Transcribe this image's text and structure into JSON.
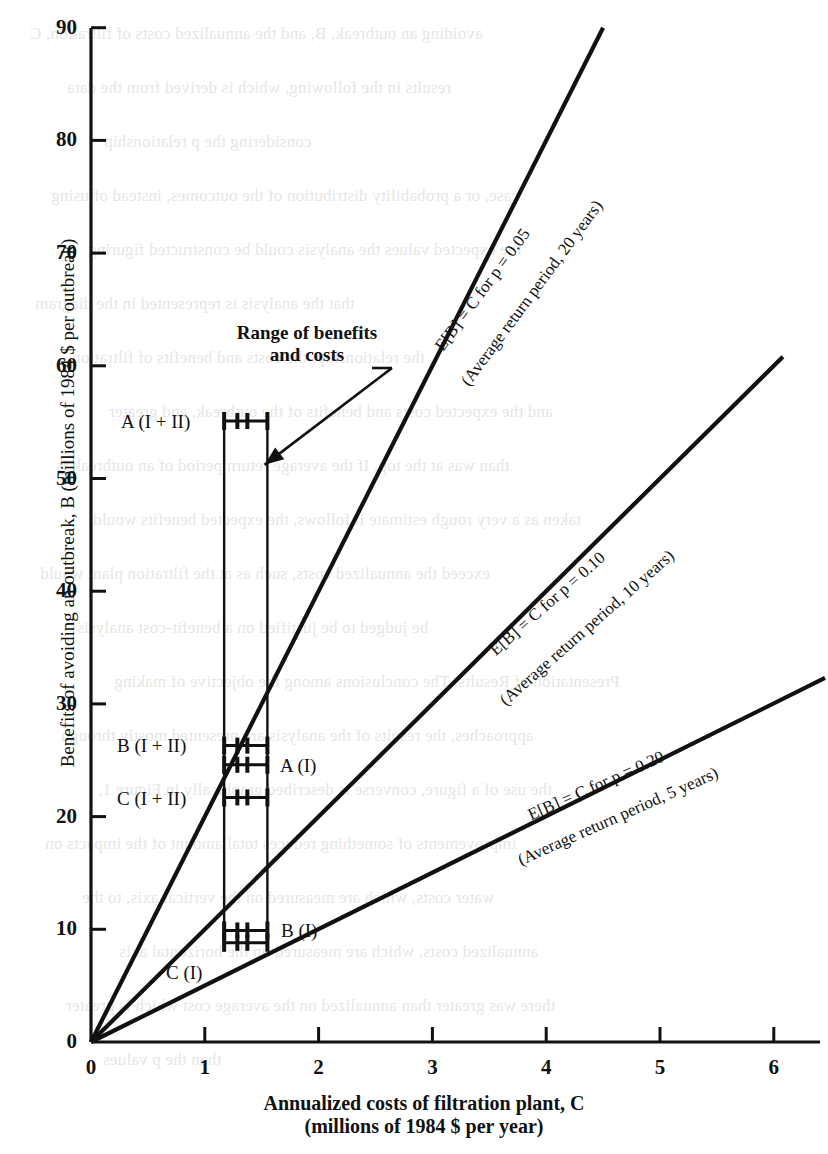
{
  "chart_data": {
    "type": "line",
    "title": "",
    "xlabel": "Annualized costs of filtration plant, C",
    "xlabel_sub": "(millions of 1984 $ per year)",
    "ylabel": "Benefits of avoiding an outbreak, B (millions of 1984 $ per outbreak)",
    "xlim": [
      0,
      6.45
    ],
    "ylim": [
      0,
      90
    ],
    "xticks": [
      "0",
      "1",
      "2",
      "3",
      "4",
      "5",
      "6"
    ],
    "xtick_values": [
      0,
      1,
      2,
      3,
      4,
      5,
      6
    ],
    "yticks": [
      "0",
      "10",
      "20",
      "30",
      "40",
      "50",
      "60",
      "70",
      "80",
      "90"
    ],
    "ytick_values": [
      0,
      10,
      20,
      30,
      40,
      50,
      60,
      70,
      80,
      90
    ],
    "grid": false,
    "legend": "none",
    "series": [
      {
        "name": "E[B] = C for p = 0.05",
        "slope": 20,
        "p": 0.05,
        "return_period_years": 20,
        "label_line1": "E[B] = C for p = 0.05",
        "label_line2": "(Average return period, 20 years)",
        "x": [
          0,
          4.5
        ],
        "y": [
          0,
          90
        ]
      },
      {
        "name": "E[B] = C for p = 0.10",
        "slope": 10,
        "p": 0.1,
        "return_period_years": 10,
        "label_line1": "E[B] = C for p = 0.10",
        "label_line2": "(Average return period, 10 years)",
        "x": [
          0,
          6.08
        ],
        "y": [
          0,
          60.8
        ]
      },
      {
        "name": "E[B] = C for p = 0.20",
        "slope": 5,
        "p": 0.2,
        "return_period_years": 5,
        "label_line1": "E[B] = C for p = 0.20",
        "label_line2": "(Average return period, 5 years)",
        "x": [
          0,
          6.45
        ],
        "y": [
          0,
          32.3
        ]
      }
    ],
    "range_box": {
      "x_min": 1.17,
      "x_max": 1.55,
      "y_min": 8.8,
      "y_max": 55.1
    },
    "points": [
      {
        "label": "A (I + II)",
        "label_text": "A (I + II)",
        "series": "A",
        "scenario": "I + II",
        "x_min": 1.17,
        "x_mid": 1.33,
        "x_max": 1.55,
        "y": 55.1
      },
      {
        "label": "B (I + II)",
        "label_text": "B (I + II)",
        "series": "B",
        "scenario": "I + II",
        "x_min": 1.17,
        "x_mid": 1.33,
        "x_max": 1.55,
        "y": 26.3
      },
      {
        "label": "A (I)",
        "label_text": "A (I)",
        "series": "A",
        "scenario": "I",
        "x_min": 1.17,
        "x_mid": 1.33,
        "x_max": 1.55,
        "y": 24.6
      },
      {
        "label": "C (I + II)",
        "label_text": "C (I + II)",
        "series": "C",
        "scenario": "I + II",
        "x_min": 1.17,
        "x_mid": 1.33,
        "x_max": 1.55,
        "y": 21.7
      },
      {
        "label": "B (I)",
        "label_text": "B (I)",
        "series": "B",
        "scenario": "I",
        "x_min": 1.17,
        "x_mid": 1.33,
        "x_max": 1.55,
        "y": 9.9
      },
      {
        "label": "C (I)",
        "label_text": "C (I)",
        "series": "C",
        "scenario": "I",
        "x_min": 1.17,
        "x_mid": 1.33,
        "x_max": 1.55,
        "y": 8.8
      }
    ],
    "annotations": [
      {
        "name": "range-callout",
        "line1": "Range of benefits",
        "line2": "and costs",
        "arrow_from": [
          2.23,
          52.0
        ],
        "arrow_to": [
          1.42,
          50.5
        ]
      }
    ],
    "colors": {
      "ink": "#111111",
      "background": "#ffffff"
    }
  },
  "ghost_text": {
    "note": "faint show-through text from the reverse side of the printed page",
    "lines": [
      "avoiding an outbreak, B, and the annualized costs of filtration, C",
      "results in the following, which is derived from the data",
      "considering the p relationship",
      "case, or a probability distribution of the outcomes, instead of using",
      "the expected values the analysis could be constructed figuring",
      "that the analysis is represented in the diagram",
      "the relationship, the costs and benefits of filtration",
      "and the expected costs and benefits of the outbreak, and greater",
      "than was at the top. If the average return period of an outbreak is",
      "taken as a very rough estimate it follows, the expected benefits would",
      "exceed the annualized costs, such as at the filtration plant would",
      "be judged to be justified on a benefit-cost analysis",
      "Presentation of Results. The conclusions among the objective of making",
      "approaches, the results of the analysis are presented mostly through",
      "the use of a figure, converse is described graphically in Figure 1,",
      "improvements of something reduces total amount of the impacts on",
      "water costs, which are measured on the vertical axis, to the",
      "annualized costs, which are measured on the horizontal axis",
      "there was greater than annualized on the average cost which is greater",
      "than the p values"
    ]
  }
}
